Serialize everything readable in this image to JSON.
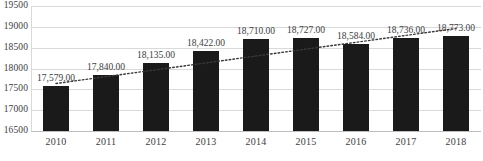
{
  "chart_data": {
    "type": "bar",
    "title": "",
    "subtitle": "",
    "xlabel": "",
    "ylabel": "",
    "categories": [
      "2010",
      "2011",
      "2012",
      "2013",
      "2014",
      "2015",
      "2016",
      "2017",
      "2018"
    ],
    "values": [
      17579,
      17840,
      18135,
      18422,
      18710,
      18727,
      18584,
      18736,
      18773
    ],
    "data_labels": [
      "17,579.00",
      "17,840.00",
      "18,135.00",
      "18,422.00",
      "18,710.00",
      "18,727.00",
      "18,584.00",
      "18,736.00",
      "18,773.00"
    ],
    "ylim": [
      16500,
      19500
    ],
    "ytick_values": [
      16500,
      17000,
      17500,
      18000,
      18500,
      19000,
      19500
    ],
    "ytick_labels": [
      "16500",
      "17000",
      "17500",
      "18000",
      "18500",
      "19000",
      "19500"
    ],
    "grid": true,
    "legend": false,
    "legend_position": "none",
    "series": [
      {
        "name": "bars",
        "type": "bar",
        "color": "#1a1a1a",
        "values": [
          17579,
          17840,
          18135,
          18422,
          18710,
          18727,
          18584,
          18736,
          18773
        ]
      },
      {
        "name": "trendline",
        "type": "line",
        "style": "dotted",
        "color": "#3a3a3a",
        "values": [
          17640,
          17805,
          17970,
          18135,
          18300,
          18465,
          18630,
          18795,
          18960
        ]
      }
    ],
    "colors": {
      "bar": "#1a1a1a",
      "gridline": "#d9d9d9",
      "baseline": "#bdbdbd",
      "text": "#3d3d3d",
      "trendline": "#3a3a3a",
      "background": "#ffffff"
    }
  }
}
